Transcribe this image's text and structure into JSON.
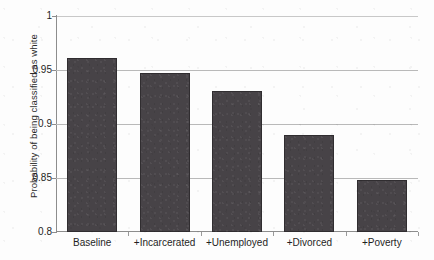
{
  "chart_data": {
    "type": "bar",
    "title": "",
    "xlabel": "",
    "ylabel": "Probability of being classified as white",
    "categories": [
      "Baseline",
      "+Incarcerated",
      "+Unemployed",
      "+Divorced",
      "+Poverty"
    ],
    "values": [
      0.961,
      0.947,
      0.931,
      0.89,
      0.848
    ],
    "series": [
      {
        "name": "Probability of being classified as white",
        "values": [
          0.961,
          0.947,
          0.931,
          0.89,
          0.848
        ]
      }
    ],
    "ylim": [
      0.8,
      1.0
    ],
    "ytick_labels": [
      "1",
      "0.95",
      "0.9",
      "0.85",
      "0.8"
    ],
    "ytick_values": [
      1.0,
      0.95,
      0.9,
      0.85,
      0.8
    ],
    "grid": true,
    "grid_axis": "y",
    "legend": false,
    "legend_position": "none",
    "bar_color": "#474347",
    "gridline_color": "#b9b9b9",
    "axis_color": "#8d8d8d",
    "background_color": "#ffffff"
  }
}
